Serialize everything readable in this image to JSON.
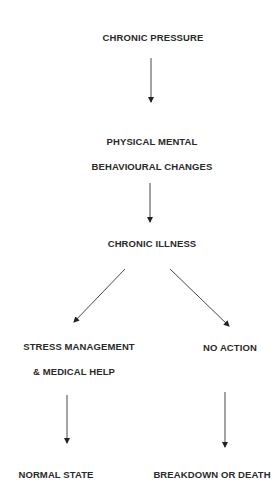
{
  "diagram": {
    "type": "flowchart",
    "nodes": {
      "chronic_pressure": "CHRONIC PRESSURE",
      "physical_mental": "PHYSICAL MENTAL",
      "behavioural_changes": "BEHAVIOURAL CHANGES",
      "chronic_illness": "CHRONIC ILLNESS",
      "stress_management": "STRESS MANAGEMENT",
      "medical_help": "& MEDICAL HELP",
      "no_action": "NO ACTION",
      "normal_state": "NORMAL STATE",
      "breakdown_or_death": "BREAKDOWN OR DEATH"
    },
    "edges": [
      {
        "from": "CHRONIC PRESSURE",
        "to": "PHYSICAL MENTAL BEHAVIOURAL CHANGES"
      },
      {
        "from": "PHYSICAL MENTAL BEHAVIOURAL CHANGES",
        "to": "CHRONIC ILLNESS"
      },
      {
        "from": "CHRONIC ILLNESS",
        "to": "STRESS MANAGEMENT & MEDICAL HELP"
      },
      {
        "from": "CHRONIC ILLNESS",
        "to": "NO ACTION"
      },
      {
        "from": "STRESS MANAGEMENT & MEDICAL HELP",
        "to": "NORMAL STATE"
      },
      {
        "from": "NO ACTION",
        "to": "BREAKDOWN OR DEATH"
      }
    ]
  }
}
